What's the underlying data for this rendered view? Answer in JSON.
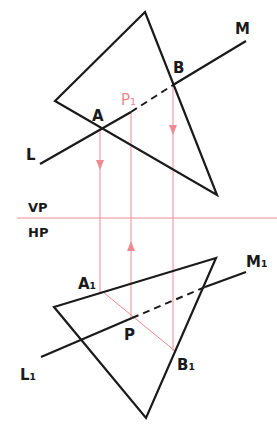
{
  "colors": {
    "ink": "#1a1a1a",
    "projector": "#f08a90",
    "background": "#ffffff"
  },
  "labels": {
    "A": "A",
    "B": "B",
    "P1": "P₁",
    "L": "L",
    "M": "M",
    "VP": "VP",
    "HP": "HP",
    "A1": "A₁",
    "B1": "B₁",
    "P": "P",
    "L1": "L₁",
    "M1": "M₁"
  },
  "front_view": {
    "triangle": [
      [
        145,
        12
      ],
      [
        55,
        101
      ],
      [
        217,
        195
      ]
    ],
    "line_LM": {
      "L": [
        40,
        164
      ],
      "M": [
        246,
        41
      ]
    },
    "A": [
      100,
      127
    ],
    "B": [
      173,
      85
    ],
    "P1": [
      131,
      112
    ]
  },
  "xy_line": {
    "y": 218,
    "x1": 17,
    "x2": 277
  },
  "top_view": {
    "triangle": [
      [
        216,
        258
      ],
      [
        54,
        307
      ],
      [
        146,
        418
      ]
    ],
    "line_L1M1": {
      "L1": [
        41,
        357
      ],
      "M1": [
        246,
        272
      ]
    },
    "A1": [
      103,
      292
    ],
    "B1": [
      175,
      351
    ],
    "P": [
      132,
      318
    ]
  }
}
